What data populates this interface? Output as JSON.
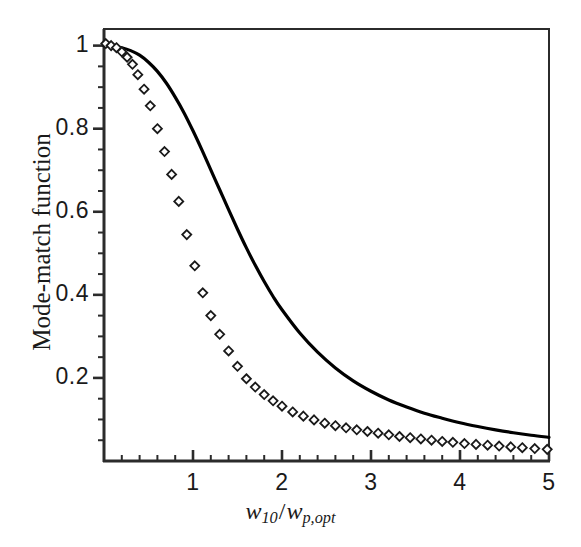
{
  "chart_data": {
    "type": "line",
    "title": "",
    "subtitle": "",
    "xlabel": "w10/wp,opt",
    "xlabel_parts": {
      "var1": "w",
      "sub1": "10",
      "separator": "/",
      "var2": "w",
      "sub2": "p,opt"
    },
    "ylabel": "Mode-match function",
    "xlim": [
      0,
      5
    ],
    "ylim": [
      0,
      1.04
    ],
    "grid": false,
    "legend": "none",
    "x_ticks": [
      1,
      2,
      3,
      4,
      5
    ],
    "x_tick_labels": [
      "1",
      "2",
      "3",
      "4",
      "5"
    ],
    "x_minor_tick_step": 0.2,
    "y_ticks": [
      0.2,
      0.4,
      0.6,
      0.8,
      1
    ],
    "y_tick_labels": [
      "0.2",
      "0.4",
      "0.6",
      "0.8",
      "1"
    ],
    "y_minor_tick_step": 0.05,
    "series": [
      {
        "name": "theory-curve",
        "style": "solid-line",
        "color": "#000000",
        "linewidth": 3.2,
        "x": [
          0,
          0.1,
          0.2,
          0.3,
          0.4,
          0.5,
          0.6,
          0.7,
          0.8,
          0.9,
          1.0,
          1.1,
          1.2,
          1.3,
          1.4,
          1.5,
          1.6,
          1.7,
          1.8,
          1.9,
          2.0,
          2.2,
          2.4,
          2.6,
          2.8,
          3.0,
          3.2,
          3.4,
          3.6,
          3.8,
          4.0,
          4.2,
          4.4,
          4.6,
          4.8,
          5.0
        ],
        "y": [
          1.0,
          0.999,
          0.995,
          0.988,
          0.977,
          0.96,
          0.938,
          0.91,
          0.876,
          0.838,
          0.795,
          0.749,
          0.701,
          0.653,
          0.605,
          0.558,
          0.513,
          0.471,
          0.432,
          0.396,
          0.364,
          0.308,
          0.262,
          0.224,
          0.193,
          0.168,
          0.147,
          0.13,
          0.115,
          0.103,
          0.092,
          0.083,
          0.075,
          0.068,
          0.062,
          0.057
        ]
      },
      {
        "name": "measured-points",
        "style": "open-diamond-markers",
        "color": "#1a1a1a",
        "marker_size": 9,
        "x": [
          0.02,
          0.08,
          0.14,
          0.2,
          0.26,
          0.32,
          0.38,
          0.45,
          0.52,
          0.6,
          0.68,
          0.76,
          0.84,
          0.93,
          1.02,
          1.11,
          1.2,
          1.3,
          1.4,
          1.5,
          1.6,
          1.7,
          1.8,
          1.9,
          2.0,
          2.12,
          2.24,
          2.36,
          2.48,
          2.6,
          2.72,
          2.84,
          2.96,
          3.08,
          3.2,
          3.32,
          3.44,
          3.56,
          3.68,
          3.8,
          3.92,
          4.05,
          4.18,
          4.31,
          4.44,
          4.57,
          4.7,
          4.84,
          4.98
        ],
        "y": [
          1.005,
          1.0,
          0.995,
          0.985,
          0.972,
          0.955,
          0.93,
          0.895,
          0.855,
          0.8,
          0.745,
          0.69,
          0.625,
          0.545,
          0.47,
          0.405,
          0.35,
          0.305,
          0.265,
          0.228,
          0.198,
          0.178,
          0.16,
          0.145,
          0.132,
          0.118,
          0.108,
          0.099,
          0.091,
          0.085,
          0.08,
          0.075,
          0.071,
          0.067,
          0.063,
          0.059,
          0.056,
          0.053,
          0.05,
          0.047,
          0.045,
          0.042,
          0.04,
          0.038,
          0.036,
          0.034,
          0.032,
          0.03,
          0.028
        ]
      }
    ]
  },
  "axes": {
    "frame_color": "#2b2b2b",
    "text_color": "#1a1a1a",
    "background": "#ffffff"
  }
}
